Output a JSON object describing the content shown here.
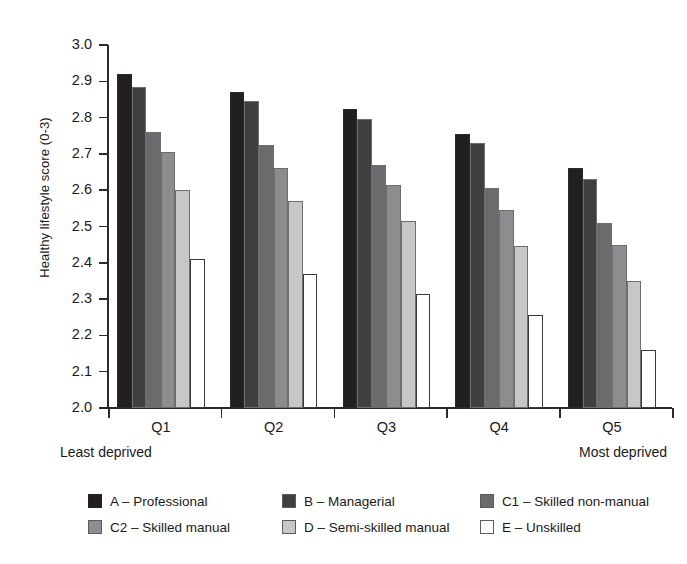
{
  "chart_data": {
    "type": "bar",
    "title": "",
    "subtitle": "",
    "xlabel": "",
    "ylabel": "Healthy lifestyle score (0-3)",
    "categories": [
      "Q1",
      "Q2",
      "Q3",
      "Q4",
      "Q5"
    ],
    "category_notes": {
      "first": "Least deprived",
      "last": "Most deprived"
    },
    "ylim": [
      2.0,
      3.0
    ],
    "ytick_labels": [
      "3.0",
      "2.9",
      "2.8",
      "2.7",
      "2.6",
      "2.5",
      "2.4",
      "2.3",
      "2.2",
      "2.1",
      "2.0"
    ],
    "ytick_values": [
      3.0,
      2.9,
      2.8,
      2.7,
      2.6,
      2.5,
      2.4,
      2.3,
      2.2,
      2.1,
      2.0
    ],
    "grid": false,
    "legend_position": "bottom",
    "series": [
      {
        "name": "A – Professional",
        "color": "#231f20",
        "values": [
          2.92,
          2.87,
          2.825,
          2.755,
          2.66
        ]
      },
      {
        "name": "B – Managerial",
        "color": "#3f3f41",
        "values": [
          2.885,
          2.845,
          2.795,
          2.73,
          2.63
        ]
      },
      {
        "name": "C1 – Skilled non-manual",
        "color": "#6b6b6d",
        "values": [
          2.76,
          2.725,
          2.67,
          2.605,
          2.51
        ]
      },
      {
        "name": "C2 – Skilled manual",
        "color": "#8d8d8f",
        "values": [
          2.705,
          2.66,
          2.615,
          2.545,
          2.45
        ]
      },
      {
        "name": "D – Semi-skilled manual",
        "color": "#c7c7c9",
        "values": [
          2.6,
          2.57,
          2.515,
          2.445,
          2.35
        ]
      },
      {
        "name": "E – Unskilled",
        "color": "#ffffff",
        "values": [
          2.41,
          2.37,
          2.315,
          2.255,
          2.16
        ]
      }
    ]
  },
  "legend": {
    "rows": [
      [
        "A – Professional",
        "B – Managerial",
        "C1 – Skilled non-manual"
      ],
      [
        "C2 – Skilled manual",
        "D – Semi-skilled manual",
        "E – Unskilled"
      ]
    ]
  }
}
